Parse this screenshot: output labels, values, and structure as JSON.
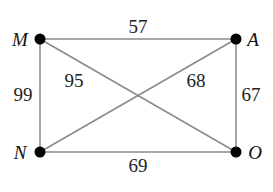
{
  "graph": {
    "nodes": [
      {
        "id": "M",
        "label": "M",
        "x": 40,
        "y": 39,
        "label_x": 20,
        "label_y": 46
      },
      {
        "id": "A",
        "label": "A",
        "x": 236,
        "y": 39,
        "label_x": 253,
        "label_y": 46
      },
      {
        "id": "N",
        "label": "N",
        "x": 40,
        "y": 152,
        "label_x": 20,
        "label_y": 159
      },
      {
        "id": "O",
        "label": "O",
        "x": 236,
        "y": 152,
        "label_x": 255,
        "label_y": 159
      }
    ],
    "edges": [
      {
        "from": "M",
        "to": "A",
        "weight": "57",
        "label_x": 138,
        "label_y": 33
      },
      {
        "from": "M",
        "to": "O",
        "weight": "95",
        "label_x": 74,
        "label_y": 87
      },
      {
        "from": "A",
        "to": "N",
        "weight": "68",
        "label_x": 196,
        "label_y": 87
      },
      {
        "from": "M",
        "to": "N",
        "weight": "99",
        "label_x": 23,
        "label_y": 101
      },
      {
        "from": "A",
        "to": "O",
        "weight": "67",
        "label_x": 251,
        "label_y": 101
      },
      {
        "from": "N",
        "to": "O",
        "weight": "69",
        "label_x": 138,
        "label_y": 172
      }
    ]
  },
  "colors": {
    "edge": "#8a8a8a",
    "node": "#000000",
    "text": "#111111"
  }
}
